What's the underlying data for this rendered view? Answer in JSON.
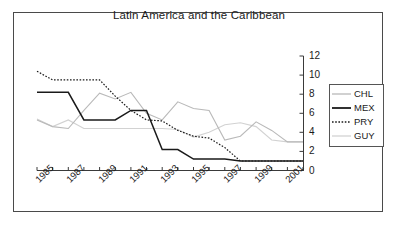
{
  "chart_data": {
    "type": "line",
    "title": "Latin America and the Caribbean",
    "xlabel": "",
    "ylabel": "",
    "ylim": [
      0,
      12
    ],
    "yticks": [
      0,
      2,
      4,
      6,
      8,
      10,
      12
    ],
    "grid": false,
    "legend_position": "right",
    "axis_position": "y-right",
    "x": [
      1985,
      1986,
      1987,
      1988,
      1989,
      1990,
      1991,
      1992,
      1993,
      1994,
      1995,
      1996,
      1997,
      1998,
      1999,
      2000,
      2001,
      2002
    ],
    "xtick_labels": [
      "1985",
      "1987",
      "1989",
      "1991",
      "1993",
      "1995",
      "1997",
      "1999",
      "2001"
    ],
    "series": [
      {
        "name": "CHL",
        "style": "solid-light",
        "color": "#b9b9b9",
        "values": [
          5.3,
          4.6,
          4.4,
          6.3,
          8.1,
          7.5,
          8.2,
          6.0,
          5.3,
          7.2,
          6.5,
          6.3,
          3.2,
          3.6,
          5.1,
          4.2,
          3.0,
          3.0
        ]
      },
      {
        "name": "MEX",
        "style": "solid-dark",
        "color": "#1a1a1a",
        "values": [
          8.2,
          8.2,
          8.2,
          5.3,
          5.3,
          5.3,
          6.3,
          6.3,
          2.2,
          2.2,
          1.2,
          1.2,
          1.2,
          1.0,
          1.0,
          1.0,
          1.0,
          1.0
        ]
      },
      {
        "name": "PRY",
        "style": "dotted-dark",
        "color": "#1a1a1a",
        "values": [
          10.4,
          9.5,
          9.5,
          9.5,
          9.5,
          7.8,
          6.3,
          5.3,
          5.2,
          4.2,
          3.6,
          3.4,
          2.4,
          1.0,
          1.0,
          1.0,
          1.0,
          1.0
        ]
      },
      {
        "name": "GUY",
        "style": "solid-pale",
        "color": "#d2d2d2",
        "values": [
          5.4,
          4.6,
          5.3,
          4.4,
          4.4,
          4.4,
          4.4,
          4.4,
          4.4,
          4.3,
          3.5,
          4.0,
          4.8,
          5.0,
          4.6,
          3.2,
          3.0,
          3.0
        ]
      }
    ]
  },
  "legend": {
    "items": [
      {
        "label": "CHL"
      },
      {
        "label": "MEX"
      },
      {
        "label": "PRY"
      },
      {
        "label": "GUY"
      }
    ]
  }
}
